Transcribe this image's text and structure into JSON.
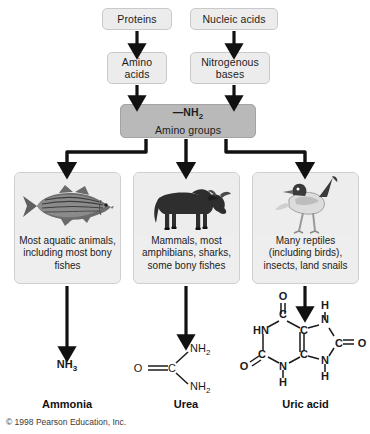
{
  "diagram": {
    "copyright": "© 1998 Pearson Education, Inc."
  },
  "sources": [
    {
      "id": "proteins",
      "label": "Proteins"
    },
    {
      "id": "nucleic",
      "label": "Nucleic acids"
    }
  ],
  "intermediates": [
    {
      "id": "amino_acids",
      "label": "Amino acids"
    },
    {
      "id": "nitrogenous_bases",
      "label": "Nitrogenous bases"
    }
  ],
  "amino_group_box": {
    "formula": "—NH",
    "formula_sub": "2",
    "label": "Amino groups"
  },
  "organism_groups": [
    {
      "id": "aquatic",
      "icon": "fish-icon",
      "caption": "Most aquatic animals, including most bony fishes"
    },
    {
      "id": "mammals",
      "icon": "wildebeest-icon",
      "caption": "Mammals, most amphibians, sharks, some bony fishes"
    },
    {
      "id": "reptiles",
      "icon": "bird-icon",
      "caption": "Many reptiles (including birds), insects, land snails"
    }
  ],
  "waste_products": [
    {
      "id": "ammonia",
      "name": "Ammonia",
      "formula": "NH",
      "formula_sub": "3",
      "structure_type": "text-formula"
    },
    {
      "id": "urea",
      "name": "Urea",
      "structure_type": "skeletal",
      "atoms": [
        "O",
        "C",
        "NH2",
        "NH2"
      ]
    },
    {
      "id": "uric_acid",
      "name": "Uric acid",
      "structure_type": "skeletal-purine",
      "atoms": [
        "O",
        "C",
        "HN",
        "C",
        "C",
        "N",
        "H",
        "C",
        "O",
        "O",
        "C",
        "N",
        "H",
        "N",
        "H"
      ]
    }
  ],
  "colors": {
    "box_light": "#ececec",
    "box_dark": "#b9b9b9",
    "panel": "#eeeeee",
    "arrow": "#111111",
    "text": "#1a1a1a"
  }
}
